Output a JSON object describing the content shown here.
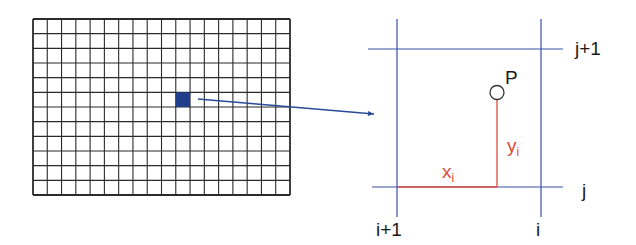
{
  "grid": {
    "columns": 18,
    "rows": 12,
    "x": 33,
    "y": 19,
    "width": 257,
    "height": 176,
    "line_color": "#2b2b2b",
    "highlight": {
      "col": 10,
      "row": 5,
      "color": "#1f3f8c"
    }
  },
  "arrow": {
    "from": [
      198,
      99
    ],
    "to": [
      374,
      114
    ],
    "color": "#2a4a9a"
  },
  "cell_detail": {
    "line_color": "#3a4fa8",
    "point_label": "P",
    "top_label": "j+1",
    "bottom_label": "j",
    "left_label": "i+1",
    "right_label": "i",
    "x_label": "x",
    "x_sub": "i",
    "y_label": "y",
    "y_sub": "i",
    "offset_color": "#e04a3c"
  }
}
